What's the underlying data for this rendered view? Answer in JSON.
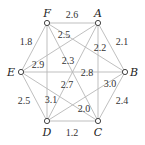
{
  "graph": {
    "nodes": [
      {
        "id": "F",
        "x": 47,
        "y": 23,
        "lx": 47,
        "ly": 17
      },
      {
        "id": "A",
        "x": 98,
        "y": 23,
        "lx": 98,
        "ly": 17
      },
      {
        "id": "E",
        "x": 21,
        "y": 72,
        "lx": 11,
        "ly": 76
      },
      {
        "id": "B",
        "x": 125,
        "y": 72,
        "lx": 134,
        "ly": 76
      },
      {
        "id": "D",
        "x": 47,
        "y": 121,
        "lx": 47,
        "ly": 136
      },
      {
        "id": "C",
        "x": 98,
        "y": 121,
        "lx": 98,
        "ly": 136
      }
    ],
    "edges": [
      {
        "from": "F",
        "to": "A",
        "weight": "2.6",
        "lx": 72,
        "ly": 18
      },
      {
        "from": "A",
        "to": "B",
        "weight": "2.1",
        "lx": 122,
        "ly": 45
      },
      {
        "from": "F",
        "to": "E",
        "weight": "1.8",
        "lx": 26,
        "ly": 45
      },
      {
        "from": "E",
        "to": "D",
        "weight": "2.5",
        "lx": 24,
        "ly": 104
      },
      {
        "from": "D",
        "to": "C",
        "weight": "1.2",
        "lx": 72,
        "ly": 136
      },
      {
        "from": "C",
        "to": "B",
        "weight": "2.4",
        "lx": 122,
        "ly": 104
      },
      {
        "from": "F",
        "to": "B",
        "weight": "2.5",
        "lx": 64,
        "ly": 38
      },
      {
        "from": "A",
        "to": "E",
        "weight": "2.9",
        "lx": 38,
        "ly": 68
      },
      {
        "from": "A",
        "to": "C",
        "weight": "2.2",
        "lx": 100,
        "ly": 51
      },
      {
        "from": "F",
        "to": "C",
        "weight": "2.3",
        "lx": 68,
        "ly": 64
      },
      {
        "from": "E",
        "to": "B",
        "weight": "2.8",
        "lx": 87,
        "ly": 76
      },
      {
        "from": "A",
        "to": "D",
        "weight": "2.7",
        "lx": 67,
        "ly": 88
      },
      {
        "from": "F",
        "to": "D",
        "weight": "3.1",
        "lx": 51,
        "ly": 103
      },
      {
        "from": "D",
        "to": "B",
        "weight": "3.0",
        "lx": 110,
        "ly": 87
      },
      {
        "from": "E",
        "to": "C",
        "weight": "2.0",
        "lx": 84,
        "ly": 112
      }
    ]
  }
}
